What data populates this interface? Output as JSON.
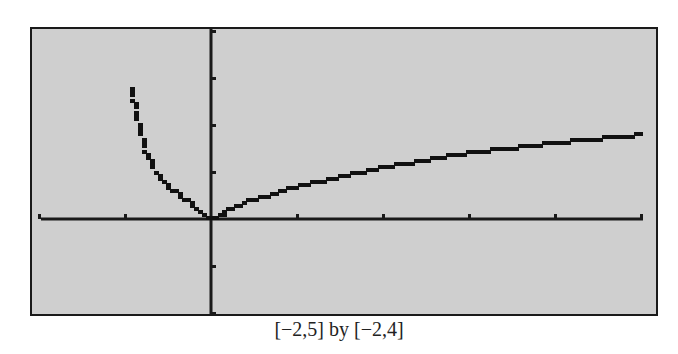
{
  "chart_data": {
    "type": "line",
    "title": "",
    "caption": "[−2,5] by [−2,4]",
    "xlabel": "",
    "ylabel": "",
    "xlim": [
      -2,
      5
    ],
    "ylim": [
      -2,
      4
    ],
    "xticks": [
      -2,
      -1,
      1,
      2,
      3,
      4,
      5
    ],
    "yticks": [
      -2,
      -1,
      1,
      2,
      3,
      4
    ],
    "grid": false,
    "legend": null,
    "style": "graphing-calculator pixelated plot, gray screen, black axes",
    "series": [
      {
        "name": "left branch",
        "x": [
          -0.94,
          -0.85,
          -0.78,
          -0.69,
          -0.59,
          -0.48,
          -0.34,
          -0.24,
          -0.13,
          0
        ],
        "y": [
          2.79,
          2.11,
          1.53,
          1.15,
          0.87,
          0.66,
          0.47,
          0.34,
          0.15,
          0
        ]
      },
      {
        "name": "right branch",
        "x": [
          0,
          0.43,
          1,
          2,
          3,
          4,
          5
        ],
        "y": [
          0,
          0.38,
          0.68,
          1.1,
          1.4,
          1.62,
          1.79
        ]
      }
    ]
  }
}
